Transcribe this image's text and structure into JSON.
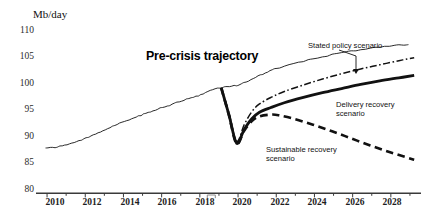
{
  "chart_data": {
    "type": "line",
    "title": "",
    "xlabel": "",
    "ylabel": "Mb/day",
    "unit_label": "Mb/day",
    "ylim": [
      80,
      110
    ],
    "yticks": [
      110,
      105,
      100,
      95,
      90,
      85,
      80
    ],
    "xlim": [
      2009.5,
      2029.5
    ],
    "xticks_labeled": [
      2010,
      2012,
      2014,
      2016,
      2018,
      2020,
      2022,
      2024,
      2026,
      2028
    ],
    "xticks_minor": [
      2011,
      2013,
      2015,
      2017,
      2019,
      2021,
      2023,
      2025,
      2027,
      2029
    ],
    "grid": false,
    "legend_position": "inline-annotations",
    "axis_break_at": 2018.6,
    "series": [
      {
        "name": "Historical and pre-crisis trajectory",
        "style": "thin-solid-jagged",
        "x": [
          2010.0,
          2010.5,
          2011.0,
          2011.5,
          2012.0,
          2012.5,
          2013.0,
          2013.5,
          2014.0,
          2014.5,
          2015.0,
          2015.5,
          2016.0,
          2016.5,
          2017.0,
          2017.5,
          2018.0,
          2018.5,
          2019.0,
          2019.5,
          2020.0,
          2020.5,
          2021.0,
          2021.5,
          2022.0,
          2023.0,
          2024.0,
          2025.0,
          2026.0,
          2027.0,
          2028.0,
          2029.0
        ],
        "y": [
          87.0,
          87.2,
          87.5,
          88.0,
          88.6,
          89.3,
          90.0,
          90.7,
          91.4,
          92.0,
          92.6,
          93.2,
          93.8,
          94.3,
          94.9,
          95.4,
          95.9,
          96.6,
          97.2,
          97.4,
          97.6,
          98.2,
          99.0,
          99.7,
          100.4,
          101.3,
          102.1,
          102.8,
          103.4,
          103.9,
          104.3,
          104.5
        ]
      },
      {
        "name": "Stated policy scenario",
        "style": "dash-dot",
        "x": [
          2019.2,
          2019.6,
          2020.0,
          2020.4,
          2020.8,
          2021.2,
          2021.8,
          2022.5,
          2023.5,
          2024.5,
          2025.5,
          2026.5,
          2027.5,
          2028.5,
          2029.3
        ],
        "y": [
          97.2,
          93.0,
          88.2,
          91.0,
          93.2,
          94.5,
          95.6,
          96.6,
          97.7,
          98.7,
          99.6,
          100.4,
          101.1,
          101.8,
          102.3
        ]
      },
      {
        "name": "Delivery recovery scenario",
        "style": "thick-solid",
        "x": [
          2019.2,
          2019.6,
          2020.0,
          2020.4,
          2020.8,
          2021.2,
          2021.8,
          2022.5,
          2023.5,
          2024.5,
          2025.5,
          2026.5,
          2027.5,
          2028.5,
          2029.3
        ],
        "y": [
          97.2,
          92.7,
          87.9,
          90.2,
          92.0,
          93.1,
          93.9,
          94.7,
          95.6,
          96.4,
          97.1,
          97.8,
          98.4,
          98.9,
          99.3
        ]
      },
      {
        "name": "Sustainable recovery scenario",
        "style": "dashed-heavy",
        "x": [
          2019.2,
          2019.6,
          2020.0,
          2020.4,
          2020.8,
          2021.2,
          2021.8,
          2022.2,
          2023.0,
          2024.0,
          2025.0,
          2026.0,
          2027.0,
          2028.0,
          2029.0,
          2029.3
        ],
        "y": [
          97.2,
          92.6,
          87.8,
          90.0,
          91.6,
          92.4,
          92.7,
          92.6,
          92.0,
          91.0,
          89.9,
          88.7,
          87.5,
          86.4,
          85.4,
          85.1
        ]
      }
    ],
    "annotations": [
      {
        "id": "pre-crisis",
        "text": "Pre-crisis trajectory",
        "bold": true
      },
      {
        "id": "stated-policy",
        "text": "Stated policy scenario",
        "leader": true
      },
      {
        "id": "delivery-recovery",
        "line1": "Delivery recovery",
        "line2": "scenario"
      },
      {
        "id": "sustainable-recovery",
        "line1": "Sustainable recovery",
        "line2": "scenario"
      }
    ],
    "colors": {
      "ink": "#111111",
      "axis": "#3a3a3a",
      "background": "#ffffff"
    }
  },
  "axis": {
    "unit": "Mb/day",
    "y": {
      "t0": "110",
      "t1": "105",
      "t2": "100",
      "t3": "95",
      "t4": "90",
      "t5": "85",
      "t6": "80"
    },
    "x": {
      "t0": "2010",
      "t1": "2012",
      "t2": "2014",
      "t3": "2016",
      "t4": "2018",
      "t5": "2020",
      "t6": "2022",
      "t7": "2024",
      "t8": "2026",
      "t9": "2028"
    }
  },
  "annotations": {
    "precrisis": "Pre-crisis trajectory",
    "stated": "Stated policy scenario",
    "delivery_l1": "Delivery recovery",
    "delivery_l2": "scenario",
    "sustainable_l1": "Sustainable recovery",
    "sustainable_l2": "scenario"
  }
}
